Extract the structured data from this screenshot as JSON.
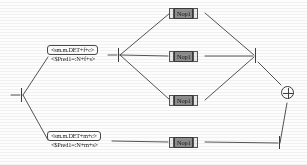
{
  "diagram": {
    "colors": {
      "line": "#3f3f3f",
      "node_fill": "#ffffff",
      "node_border": "#4a4a4a",
      "nop_fill": "#8d8d8d",
      "nop_border": "#3b3b3b",
      "background": "#fdfdfd"
    },
    "feature_nodes": [
      {
        "id": "fem-sing",
        "label": "<sm.m.DET+f+c>",
        "sublabel": "<$Pred1=:N+f+s>"
      },
      {
        "id": "masc-sing",
        "label": "<sm.m.DET+m+c>",
        "sublabel": "<$Pred1=:N+m+s>"
      }
    ],
    "operation_nodes": [
      {
        "id": "nop-top",
        "label": "Nop1"
      },
      {
        "id": "nop-middle",
        "label": "Nop1"
      },
      {
        "id": "nop-lower",
        "label": "Nop1"
      },
      {
        "id": "nop-bottom",
        "label": "Nop1"
      }
    ],
    "terminals": [
      {
        "id": "start",
        "kind": "bar",
        "label": ""
      },
      {
        "id": "fork",
        "kind": "bar",
        "label": ""
      },
      {
        "id": "join",
        "kind": "bar",
        "label": ""
      },
      {
        "id": "end",
        "kind": "circled-plus",
        "label": "⊕"
      }
    ]
  }
}
